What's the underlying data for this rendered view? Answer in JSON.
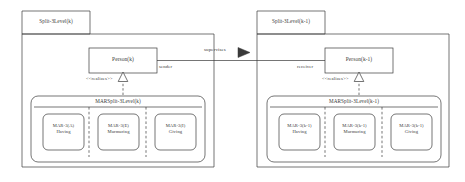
{
  "diagram": {
    "type": "uml-package-diagram",
    "stroke_color": "#3a3a3a",
    "background": "#ffffff",
    "panels": [
      {
        "id": "left",
        "package_label": "Split-3Level(k)",
        "class_label": "Person(k)",
        "role_label": "sender",
        "realization_stereotype": "<<realizes>>",
        "inner_package_label": "MARSplit-3Level(k)",
        "partitions": [
          {
            "code": "MAR-3(A)",
            "name": "Having"
          },
          {
            "code": "MAR-3(E)",
            "name": "Murmuring"
          },
          {
            "code": "MAR-3(I)",
            "name": "Giving"
          }
        ]
      },
      {
        "id": "right",
        "package_label": "Split-3Level(k-1)",
        "class_label": "Person(k-1)",
        "role_label": "receiver",
        "realization_stereotype": "<<realizes>>",
        "inner_package_label": "MARSplit-3Level(k-1)",
        "partitions": [
          {
            "code": "MAR-3(k-1)",
            "name": "Having"
          },
          {
            "code": "MAR-3(k-1)",
            "name": "Murmuring"
          },
          {
            "code": "MAR-3(k-1)",
            "name": "Giving"
          }
        ]
      }
    ],
    "association": {
      "label": "supervises",
      "arrow": "filled-triangle-right"
    }
  }
}
